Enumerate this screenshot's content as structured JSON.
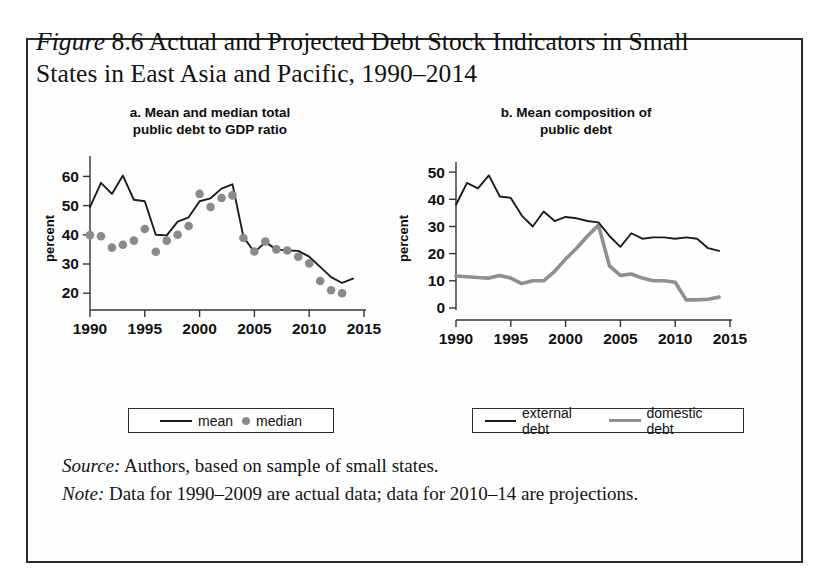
{
  "figure": {
    "label": "Figure",
    "number": "8.6",
    "title_rest": " Actual and Projected Debt Stock Indicators in Small States in East Asia and Pacific, 1990–2014"
  },
  "panels": [
    {
      "id": "a",
      "heading_line1": "a. Mean and median total",
      "heading_line2": "public debt to GDP ratio",
      "ylabel": "percent",
      "yticks": [
        "20",
        "30",
        "40",
        "50",
        "60"
      ],
      "xticks": [
        "1990",
        "1995",
        "2000",
        "2005",
        "2010",
        "2015"
      ],
      "legend": {
        "mean_label": "mean",
        "median_label": "median"
      }
    },
    {
      "id": "b",
      "heading_line1": "b. Mean composition of",
      "heading_line2": "public debt",
      "ylabel": "percent",
      "yticks": [
        "0",
        "10",
        "20",
        "30",
        "40",
        "50"
      ],
      "xticks": [
        "1990",
        "1995",
        "2000",
        "2005",
        "2010",
        "2015"
      ],
      "legend": {
        "external_label": "external debt",
        "domestic_label": "domestic debt"
      }
    }
  ],
  "footnotes": {
    "source_lead": "Source:",
    "source_text": " Authors, based on sample of small states.",
    "note_lead": "Note:",
    "note_text": " Data for 1990–2009 are actual data; data for 2010–14 are projections."
  },
  "colors": {
    "line_dark": "#1c1c1c",
    "line_gray": "#8f8f8f",
    "dot_gray": "#8a8a8a",
    "frame": "#2b2b2b"
  },
  "chart_data": [
    {
      "type": "line",
      "panel": "a",
      "title": "a. Mean and median total public debt to GDP ratio",
      "xlabel": "",
      "ylabel": "percent",
      "xlim": [
        1990,
        2015
      ],
      "ylim": [
        15,
        65
      ],
      "yticks": [
        20,
        30,
        40,
        50,
        60
      ],
      "xticks": [
        1990,
        1995,
        2000,
        2005,
        2010,
        2015
      ],
      "grid": false,
      "legend_position": "below",
      "x": [
        1990,
        1991,
        1992,
        1993,
        1994,
        1995,
        1996,
        1997,
        1998,
        1999,
        2000,
        2001,
        2002,
        2003,
        2004,
        2005,
        2006,
        2007,
        2008,
        2009,
        2010,
        2011,
        2012,
        2013,
        2014
      ],
      "series": [
        {
          "name": "mean",
          "style": "line",
          "values": [
            49.5,
            57.8,
            54.0,
            60.3,
            52.0,
            51.5,
            40.0,
            39.8,
            44.5,
            46.0,
            51.5,
            52.5,
            55.8,
            57.3,
            39.3,
            34.0,
            37.5,
            35.0,
            34.6,
            34.5,
            32.5,
            29.0,
            25.5,
            23.5,
            25.0
          ]
        },
        {
          "name": "median",
          "style": "scatter",
          "values": [
            39.9,
            39.5,
            35.6,
            36.6,
            38.0,
            42.0,
            34.2,
            38.0,
            40.0,
            43.0,
            54.0,
            49.5,
            52.6,
            53.5,
            38.9,
            34.3,
            37.7,
            35.0,
            34.6,
            32.5,
            30.2,
            24.2,
            21.0,
            20.0,
            null
          ]
        }
      ]
    },
    {
      "type": "line",
      "panel": "b",
      "title": "b. Mean composition of public debt",
      "xlabel": "",
      "ylabel": "percent",
      "xlim": [
        1990,
        2015
      ],
      "ylim": [
        0,
        53
      ],
      "yticks": [
        0,
        10,
        20,
        30,
        40,
        50
      ],
      "xticks": [
        1990,
        1995,
        2000,
        2005,
        2010,
        2015
      ],
      "grid": false,
      "legend_position": "below",
      "x": [
        1990,
        1991,
        1992,
        1993,
        1994,
        1995,
        1996,
        1997,
        1998,
        1999,
        2000,
        2001,
        2002,
        2003,
        2004,
        2005,
        2006,
        2007,
        2008,
        2009,
        2010,
        2011,
        2012,
        2013,
        2014
      ],
      "series": [
        {
          "name": "external debt",
          "style": "line",
          "values": [
            38.0,
            46.0,
            44.0,
            48.8,
            41.0,
            40.5,
            34.0,
            30.0,
            35.5,
            32.0,
            33.5,
            33.0,
            32.0,
            31.5,
            26.5,
            22.5,
            27.5,
            25.5,
            26.0,
            26.0,
            25.5,
            26.0,
            25.5,
            22.0,
            21.0
          ]
        },
        {
          "name": "domestic debt",
          "style": "line",
          "values": [
            11.8,
            11.5,
            11.2,
            11.0,
            12.0,
            11.0,
            9.0,
            10.0,
            10.0,
            13.5,
            18.0,
            22.0,
            26.5,
            30.5,
            15.5,
            12.0,
            12.5,
            11.0,
            10.0,
            10.0,
            9.5,
            3.0,
            3.0,
            3.2,
            4.0
          ]
        }
      ]
    }
  ]
}
